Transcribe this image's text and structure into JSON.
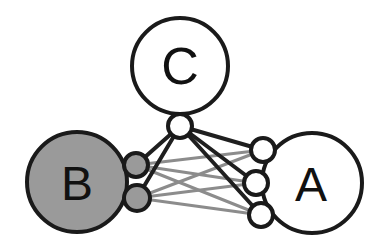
{
  "diagram": {
    "type": "node-link-graph",
    "width": 378,
    "height": 251,
    "background_color": "#ffffff",
    "colors": {
      "stroke_dark": "#1a1a1a",
      "fill_white": "#ffffff",
      "fill_gray": "#9a9a9a",
      "edge_dark": "#1f1f1f",
      "edge_gray": "#8c8c8c",
      "label_color": "#111111"
    },
    "clusters": [
      {
        "id": "C",
        "label": "C",
        "cx": 180,
        "cy": 66,
        "r": 48,
        "fill": "#ffffff",
        "stroke": "#1a1a1a",
        "stroke_width": 4,
        "label_size": 52,
        "label_x": 180,
        "label_y": 66
      },
      {
        "id": "B",
        "label": "B",
        "cx": 77,
        "cy": 182,
        "r": 50,
        "fill": "#9a9a9a",
        "stroke": "#1a1a1a",
        "stroke_width": 4,
        "label_size": 48,
        "label_x": 77,
        "label_y": 183
      },
      {
        "id": "A",
        "label": "A",
        "cx": 312,
        "cy": 183,
        "r": 50,
        "fill": "#ffffff",
        "stroke": "#1a1a1a",
        "stroke_width": 4,
        "label_size": 48,
        "label_x": 311,
        "label_y": 184
      }
    ],
    "ports": [
      {
        "id": "c-hub",
        "cluster": "C",
        "cx": 180,
        "cy": 126,
        "r": 12,
        "fill": "#ffffff",
        "stroke": "#1a1a1a",
        "stroke_width": 4
      },
      {
        "id": "b-top",
        "cluster": "B",
        "cx": 136,
        "cy": 165,
        "r": 12,
        "fill": "#9a9a9a",
        "stroke": "#1a1a1a",
        "stroke_width": 4
      },
      {
        "id": "b-bottom",
        "cluster": "B",
        "cx": 137,
        "cy": 198,
        "r": 13,
        "fill": "#9a9a9a",
        "stroke": "#1a1a1a",
        "stroke_width": 4
      },
      {
        "id": "a-top",
        "cluster": "A",
        "cx": 263,
        "cy": 150,
        "r": 12,
        "fill": "#ffffff",
        "stroke": "#1a1a1a",
        "stroke_width": 4
      },
      {
        "id": "a-middle",
        "cluster": "A",
        "cx": 256,
        "cy": 183,
        "r": 12,
        "fill": "#ffffff",
        "stroke": "#1a1a1a",
        "stroke_width": 4
      },
      {
        "id": "a-bottom",
        "cluster": "A",
        "cx": 261,
        "cy": 215,
        "r": 12,
        "fill": "#ffffff",
        "stroke": "#1a1a1a",
        "stroke_width": 4
      }
    ],
    "edges_dark": [
      {
        "from": "c-hub",
        "to": "b-top",
        "x1": 180,
        "y1": 126,
        "x2": 136,
        "y2": 165,
        "width": 4
      },
      {
        "from": "c-hub",
        "to": "b-bottom",
        "x1": 180,
        "y1": 126,
        "x2": 137,
        "y2": 198,
        "width": 4
      },
      {
        "from": "c-hub",
        "to": "a-top",
        "x1": 180,
        "y1": 126,
        "x2": 263,
        "y2": 150,
        "width": 4
      },
      {
        "from": "c-hub",
        "to": "a-middle",
        "x1": 180,
        "y1": 126,
        "x2": 256,
        "y2": 183,
        "width": 4
      },
      {
        "from": "c-hub",
        "to": "a-bottom",
        "x1": 180,
        "y1": 126,
        "x2": 261,
        "y2": 215,
        "width": 4
      }
    ],
    "edges_gray": [
      {
        "from": "b-top",
        "to": "a-top",
        "x1": 136,
        "y1": 165,
        "x2": 263,
        "y2": 150,
        "width": 3
      },
      {
        "from": "b-top",
        "to": "a-middle",
        "x1": 136,
        "y1": 165,
        "x2": 256,
        "y2": 183,
        "width": 3
      },
      {
        "from": "b-top",
        "to": "a-bottom",
        "x1": 136,
        "y1": 165,
        "x2": 261,
        "y2": 215,
        "width": 3
      },
      {
        "from": "b-bottom",
        "to": "a-top",
        "x1": 137,
        "y1": 198,
        "x2": 263,
        "y2": 150,
        "width": 3
      },
      {
        "from": "b-bottom",
        "to": "a-middle",
        "x1": 137,
        "y1": 198,
        "x2": 256,
        "y2": 183,
        "width": 3
      },
      {
        "from": "b-bottom",
        "to": "a-bottom",
        "x1": 137,
        "y1": 198,
        "x2": 261,
        "y2": 215,
        "width": 3
      }
    ]
  }
}
